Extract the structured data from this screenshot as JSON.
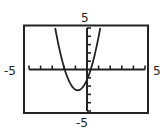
{
  "chart_data": {
    "type": "line",
    "title": "",
    "xlabel": "",
    "ylabel": "",
    "xlim": [
      -5,
      5
    ],
    "ylim": [
      -5,
      5
    ],
    "x_tick_step": 1,
    "y_tick_step": 1,
    "grid": false,
    "legend": null,
    "window_labels": {
      "ymax": "5",
      "ymin": "-5",
      "xmin": "-5",
      "xmax": "5"
    },
    "series": [
      {
        "name": "parabola",
        "equation_estimate": "y = 2(x + 0.8)^2 - 2.5",
        "vertex": [
          -0.8,
          -2.5
        ],
        "x_intercepts": [
          -1.92,
          0.32
        ],
        "y_intercept": -1.22,
        "x": [
          -2.74,
          -2.5,
          -2.0,
          -1.5,
          -1.0,
          -0.8,
          -0.5,
          0.0,
          0.5,
          1.0,
          1.14
        ],
        "y": [
          5.0,
          3.28,
          0.38,
          -1.52,
          -2.42,
          -2.5,
          -2.32,
          -1.22,
          0.88,
          3.98,
          5.0
        ]
      }
    ]
  },
  "labels": {
    "top": "5",
    "bottom": "-5",
    "left": "-5",
    "right": "5"
  },
  "colors": {
    "frame": "#222222",
    "axes": "#222222",
    "curve": "#222222",
    "background": "#ffffff"
  }
}
